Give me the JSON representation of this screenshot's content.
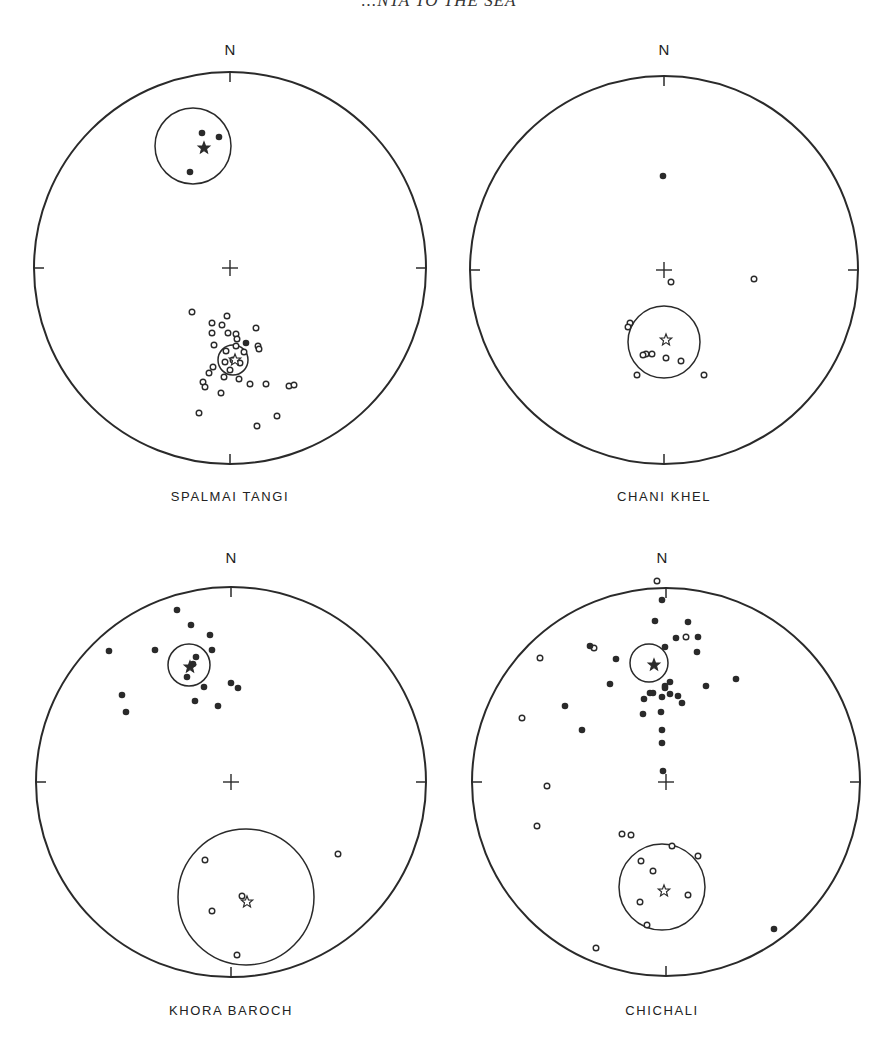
{
  "header": {
    "running_title": "...NTA TO THE SEA"
  },
  "chart_data": [
    {
      "type": "scatter",
      "title": "SPALMAI TANGI",
      "projection": "equal-area stereonet",
      "north_label": "N",
      "center": [
        230,
        268
      ],
      "radius": 196,
      "mean": {
        "symbol": "filled-star",
        "x": 204,
        "y": 148
      },
      "confidence_circle": {
        "cx": 193,
        "cy": 146,
        "r": 38
      },
      "mean_reversed": {
        "symbol": "open-star",
        "x": 235,
        "y": 360
      },
      "confidence_circle_reversed": {
        "cx": 233,
        "cy": 360,
        "r": 15
      },
      "filled_points": [
        [
          202,
          133
        ],
        [
          219,
          137
        ],
        [
          190,
          172
        ],
        [
          246,
          343
        ]
      ],
      "open_points": [
        [
          192,
          312
        ],
        [
          227,
          316
        ],
        [
          212,
          323
        ],
        [
          222,
          325
        ],
        [
          212,
          333
        ],
        [
          228,
          333
        ],
        [
          236,
          334
        ],
        [
          256,
          328
        ],
        [
          214,
          345
        ],
        [
          237,
          339
        ],
        [
          258,
          346
        ],
        [
          259,
          349
        ],
        [
          226,
          351
        ],
        [
          236,
          346
        ],
        [
          244,
          352
        ],
        [
          233,
          360
        ],
        [
          225,
          362
        ],
        [
          240,
          363
        ],
        [
          230,
          370
        ],
        [
          213,
          367
        ],
        [
          209,
          373
        ],
        [
          203,
          382
        ],
        [
          205,
          387
        ],
        [
          224,
          377
        ],
        [
          239,
          379
        ],
        [
          250,
          384
        ],
        [
          266,
          384
        ],
        [
          289,
          386
        ],
        [
          294,
          385
        ],
        [
          221,
          393
        ],
        [
          199,
          413
        ],
        [
          277,
          416
        ],
        [
          257,
          426
        ]
      ]
    },
    {
      "type": "scatter",
      "title": "CHANI KHEL",
      "projection": "equal-area stereonet",
      "north_label": "N",
      "center": [
        664,
        270
      ],
      "radius": 194,
      "mean": {
        "symbol": "open-star",
        "x": 666,
        "y": 340
      },
      "confidence_circle": {
        "cx": 664,
        "cy": 342,
        "r": 36
      },
      "filled_points": [
        [
          663,
          176
        ]
      ],
      "open_points": [
        [
          671,
          282
        ],
        [
          754,
          279
        ],
        [
          630,
          323
        ],
        [
          628,
          327
        ],
        [
          646,
          354
        ],
        [
          643,
          355
        ],
        [
          652,
          354
        ],
        [
          666,
          358
        ],
        [
          681,
          361
        ],
        [
          637,
          375
        ],
        [
          704,
          375
        ]
      ]
    },
    {
      "type": "scatter",
      "title": "KHORA BAROCH",
      "projection": "equal-area stereonet",
      "north_label": "N",
      "center": [
        231,
        782
      ],
      "radius": 195,
      "mean": {
        "symbol": "filled-star",
        "x": 190,
        "y": 667
      },
      "confidence_circle": {
        "cx": 189,
        "cy": 665,
        "r": 21
      },
      "mean_reversed": {
        "symbol": "open-star",
        "x": 247,
        "y": 902
      },
      "confidence_circle_reversed": {
        "cx": 246,
        "cy": 897,
        "r": 68
      },
      "filled_points": [
        [
          177,
          610
        ],
        [
          191,
          625
        ],
        [
          210,
          635
        ],
        [
          109,
          651
        ],
        [
          155,
          650
        ],
        [
          212,
          650
        ],
        [
          196,
          657
        ],
        [
          193,
          664
        ],
        [
          187,
          677
        ],
        [
          204,
          687
        ],
        [
          231,
          683
        ],
        [
          238,
          688
        ],
        [
          195,
          701
        ],
        [
          218,
          706
        ],
        [
          122,
          695
        ],
        [
          126,
          712
        ]
      ],
      "open_points": [
        [
          205,
          860
        ],
        [
          338,
          854
        ],
        [
          242,
          896
        ],
        [
          212,
          911
        ],
        [
          237,
          955
        ]
      ]
    },
    {
      "type": "scatter",
      "title": "CHICHALI",
      "projection": "equal-area stereonet",
      "north_label": "N",
      "center": [
        666,
        782
      ],
      "radius": 194,
      "mean": {
        "symbol": "filled-star",
        "x": 654,
        "y": 665
      },
      "confidence_circle": {
        "cx": 649,
        "cy": 663,
        "r": 19
      },
      "mean_reversed": {
        "symbol": "open-star",
        "x": 664,
        "y": 891
      },
      "confidence_circle_reversed": {
        "cx": 662,
        "cy": 887,
        "r": 43
      },
      "filled_points": [
        [
          662,
          600
        ],
        [
          655,
          621
        ],
        [
          688,
          622
        ],
        [
          676,
          638
        ],
        [
          698,
          637
        ],
        [
          590,
          646
        ],
        [
          665,
          647
        ],
        [
          697,
          652
        ],
        [
          616,
          659
        ],
        [
          610,
          684
        ],
        [
          565,
          706
        ],
        [
          665,
          688
        ],
        [
          644,
          699
        ],
        [
          650,
          693
        ],
        [
          665,
          686
        ],
        [
          670,
          682
        ],
        [
          678,
          696
        ],
        [
          653,
          693
        ],
        [
          662,
          697
        ],
        [
          670,
          694
        ],
        [
          706,
          686
        ],
        [
          736,
          679
        ],
        [
          661,
          712
        ],
        [
          643,
          714
        ],
        [
          682,
          703
        ],
        [
          662,
          730
        ],
        [
          582,
          730
        ],
        [
          662,
          743
        ],
        [
          663,
          771
        ],
        [
          774,
          929
        ]
      ],
      "open_points": [
        [
          657,
          581
        ],
        [
          540,
          658
        ],
        [
          594,
          648
        ],
        [
          686,
          637
        ],
        [
          522,
          718
        ],
        [
          547,
          786
        ],
        [
          537,
          826
        ],
        [
          622,
          834
        ],
        [
          631,
          835
        ],
        [
          672,
          846
        ],
        [
          698,
          856
        ],
        [
          641,
          861
        ],
        [
          653,
          871
        ],
        [
          688,
          895
        ],
        [
          640,
          902
        ],
        [
          647,
          925
        ],
        [
          596,
          948
        ]
      ]
    }
  ],
  "plots": {
    "p1": {
      "label": "SPALMAI TANGI",
      "north": "N"
    },
    "p2": {
      "label": "CHANI KHEL",
      "north": "N"
    },
    "p3": {
      "label": "KHORA BAROCH",
      "north": "N"
    },
    "p4": {
      "label": "CHICHALI",
      "north": "N"
    }
  }
}
